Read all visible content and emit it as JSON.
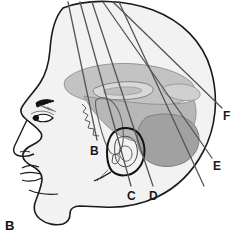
{
  "figure": {
    "panel_letter": "B",
    "panel_letter_pos": {
      "x": 5,
      "y": 219
    },
    "title": "",
    "background_color": "#ffffff"
  },
  "colors": {
    "outline": "#1a1a1a",
    "head_fill": "#f2f2f2",
    "brain_fill": "#b8b8b8",
    "brain_fill_dark": "#a0a0a0",
    "brain_fill_light": "#cccccc",
    "cerebellum_fill": "#a8a8a8",
    "needle_line": "#555555",
    "label_text": "#1a1a1a"
  },
  "anatomy": {
    "view": "lateral-head-profile",
    "structures": [
      {
        "name": "scalp-head-outline",
        "label": ""
      },
      {
        "name": "face-profile",
        "label": ""
      },
      {
        "name": "eyebrow",
        "label": ""
      },
      {
        "name": "eye",
        "label": ""
      },
      {
        "name": "nose",
        "label": ""
      },
      {
        "name": "lips",
        "label": ""
      },
      {
        "name": "chin",
        "label": ""
      },
      {
        "name": "ear-auricle",
        "label": ""
      },
      {
        "name": "corpus-callosum",
        "label": ""
      },
      {
        "name": "lateral-ventricle",
        "label": ""
      },
      {
        "name": "thalamus-brainstem",
        "label": ""
      },
      {
        "name": "cerebellum",
        "label": ""
      },
      {
        "name": "skull-base",
        "label": ""
      }
    ]
  },
  "trajectories": {
    "description": "needle / approach trajectory lines converging superiorly",
    "lines": [
      {
        "id": "B",
        "label": "B",
        "x1": 68,
        "y1": 2,
        "x2": 97,
        "y2": 140,
        "label_x": 90,
        "label_y": 145
      },
      {
        "id": "C",
        "label": "C",
        "x1": 80,
        "y1": 2,
        "x2": 131,
        "y2": 186,
        "label_x": 127,
        "label_y": 190
      },
      {
        "id": "D",
        "label": "D",
        "x1": 92,
        "y1": 2,
        "x2": 153,
        "y2": 186,
        "label_x": 149,
        "label_y": 190
      },
      {
        "id": "E",
        "label": "E",
        "x1": 103,
        "y1": 2,
        "x2": 212,
        "y2": 158,
        "label_x": 213,
        "label_y": 160
      },
      {
        "id": "F",
        "label": "F",
        "x1": 113,
        "y1": 2,
        "x2": 222,
        "y2": 108,
        "label_x": 223,
        "label_y": 110
      },
      {
        "id": "extra",
        "label": "",
        "x1": 119,
        "y1": 2,
        "x2": 204,
        "y2": 186,
        "label_x": 0,
        "label_y": 0
      }
    ]
  },
  "labels": [
    {
      "id": "label-b",
      "text": "B",
      "x": 90,
      "y": 145
    },
    {
      "id": "label-c",
      "text": "C",
      "x": 127,
      "y": 190
    },
    {
      "id": "label-d",
      "text": "D",
      "x": 149,
      "y": 190
    },
    {
      "id": "label-e",
      "text": "E",
      "x": 213,
      "y": 160
    },
    {
      "id": "label-f",
      "text": "F",
      "x": 223,
      "y": 110
    }
  ]
}
